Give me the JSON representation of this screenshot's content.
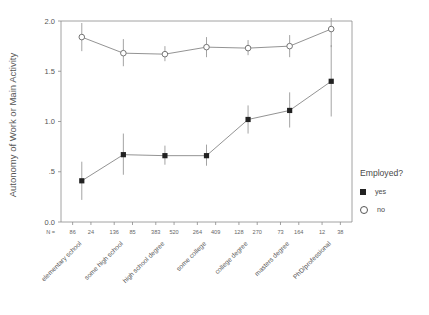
{
  "chart_data": {
    "type": "line",
    "title": "",
    "xlabel": "",
    "ylabel": "Autonomy of Work or Main Activity",
    "ylim": [
      0.0,
      2.0
    ],
    "ytick_labels": [
      "0.0",
      ".5",
      "1.0",
      "1.5",
      "2.0"
    ],
    "ytick_values": [
      0.0,
      0.5,
      1.0,
      1.5,
      2.0
    ],
    "grid": false,
    "legend_position": "right",
    "legend_title": "Employed?",
    "categories": [
      "elementary school",
      "some high school",
      "high school degree",
      "some college",
      "college degree",
      "masters degree",
      "PhD/professional"
    ],
    "n_label": "N =",
    "n_values": [
      86,
      24,
      136,
      85,
      383,
      520,
      264,
      409,
      128,
      270,
      73,
      164,
      12,
      38
    ],
    "n_pairs": [
      {
        "category": "elementary school",
        "yes": 86,
        "no": 24
      },
      {
        "category": "some high school",
        "yes": 136,
        "no": 85
      },
      {
        "category": "high school degree",
        "yes": 383,
        "no": 520
      },
      {
        "category": "some college",
        "yes": 264,
        "no": 409
      },
      {
        "category": "college degree",
        "yes": 128,
        "no": 270
      },
      {
        "category": "masters degree",
        "yes": 73,
        "no": 164
      },
      {
        "category": "PhD/professional",
        "yes": 12,
        "no": 38
      }
    ],
    "series": [
      {
        "name": "yes",
        "marker": "filled-square",
        "color": "#222222",
        "values": [
          0.41,
          0.67,
          0.66,
          0.66,
          1.02,
          1.11,
          1.4
        ],
        "error_low": [
          0.22,
          0.47,
          0.57,
          0.56,
          0.88,
          0.94,
          1.05
        ],
        "error_high": [
          0.6,
          0.88,
          0.76,
          0.77,
          1.16,
          1.29,
          1.76
        ]
      },
      {
        "name": "no",
        "marker": "open-circle",
        "color": "#666666",
        "values": [
          1.84,
          1.68,
          1.67,
          1.74,
          1.73,
          1.75,
          1.92
        ],
        "error_low": [
          1.7,
          1.55,
          1.6,
          1.64,
          1.66,
          1.64,
          1.74
        ],
        "error_high": [
          1.98,
          1.82,
          1.75,
          1.84,
          1.81,
          1.86,
          2.03
        ]
      }
    ]
  },
  "legend": {
    "title": "Employed?",
    "items": [
      {
        "label": "yes",
        "marker": "filled-square"
      },
      {
        "label": "no",
        "marker": "open-circle"
      }
    ]
  },
  "axis": {
    "y_title": "Autonomy of Work or Main Activity"
  }
}
